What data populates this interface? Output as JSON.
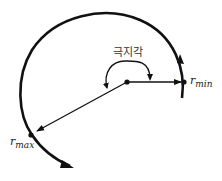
{
  "diagram": {
    "angle_label": "극지각",
    "r_min": {
      "base": "r",
      "sub": "min"
    },
    "r_max": {
      "base": "r",
      "sub": "max"
    },
    "colors": {
      "stroke": "#111111",
      "background": "#ffffff"
    }
  }
}
